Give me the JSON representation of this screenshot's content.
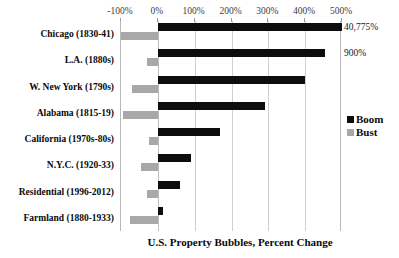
{
  "chart_data": {
    "type": "bar",
    "orientation": "horizontal",
    "title": "U.S. Property Bubbles, Percent Change",
    "xlabel": "",
    "ylabel": "",
    "xlim": [
      -100,
      500
    ],
    "xticks": [
      -100,
      0,
      100,
      200,
      300,
      400,
      500
    ],
    "xtick_labels": [
      "-100%",
      "0%",
      "100%",
      "200%",
      "300%",
      "400%",
      "500%"
    ],
    "grid": true,
    "legend_position": "right",
    "categories": [
      "Chicago (1830-41)",
      "L.A. (1880s)",
      "W. New York (1790s)",
      "Alabama (1815-19)",
      "California (1970s-80s)",
      "N.Y.C. (1920-33)",
      "Residential (1996-2012)",
      "Farmland (1880-1933)"
    ],
    "series": [
      {
        "name": "Boom",
        "color": "#0d0d0d",
        "values": [
          520,
          455,
          400,
          290,
          170,
          90,
          60,
          15
        ]
      },
      {
        "name": "Bust",
        "color": "#a8a8a8",
        "values": [
          -100,
          -30,
          -70,
          -95,
          -25,
          -45,
          -30,
          -75
        ]
      }
    ],
    "annotations": [
      {
        "category": "Chicago (1830-41)",
        "text": "40,775%"
      },
      {
        "category": "L.A. (1880s)",
        "text": "900%"
      }
    ]
  },
  "legend": {
    "items": [
      {
        "label": "Boom",
        "color": "#0d0d0d"
      },
      {
        "label": "Bust",
        "color": "#a8a8a8"
      }
    ]
  }
}
